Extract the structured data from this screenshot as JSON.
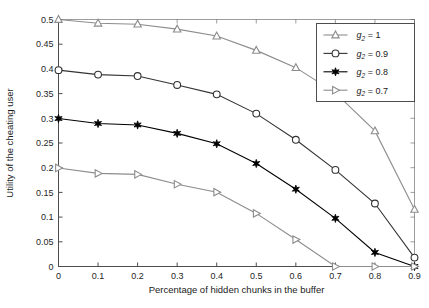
{
  "chart_data": {
    "type": "line",
    "title": "",
    "xlabel": "Percentage of hidden chunks in the buffer",
    "ylabel": "Utility of the cheating user",
    "x": [
      0,
      0.1,
      0.2,
      0.3,
      0.4,
      0.5,
      0.6,
      0.7,
      0.8,
      0.9
    ],
    "xlim": [
      0,
      0.9
    ],
    "ylim": [
      0,
      0.5
    ],
    "xticks": [
      "0",
      "0.1",
      "0.2",
      "0.3",
      "0.4",
      "0.5",
      "0.6",
      "0.7",
      "0.8",
      "0.9"
    ],
    "yticks": [
      "0",
      "0.05",
      "0.1",
      "0.15",
      "0.2",
      "0.25",
      "0.3",
      "0.35",
      "0.4",
      "0.45",
      "0.5"
    ],
    "grid": false,
    "legend_position": "upper-right",
    "series": [
      {
        "name": "g2 = 1",
        "label_var": "g",
        "label_sub": "2",
        "label_value": "= 1",
        "marker": "triangle-up",
        "marker_filled": false,
        "color": "#8c8c8c",
        "values": [
          0.5,
          0.4925,
          0.4905,
          0.4805,
          0.4665,
          0.4375,
          0.4025,
          0.3515,
          0.2745,
          0.1155
        ]
      },
      {
        "name": "g2 = 0.9",
        "label_var": "g",
        "label_sub": "2",
        "label_value": "= 0.9",
        "marker": "circle",
        "marker_filled": false,
        "color": "#333333",
        "values": [
          0.3975,
          0.3885,
          0.3855,
          0.3675,
          0.3485,
          0.3095,
          0.2565,
          0.1955,
          0.1275,
          0.018
        ]
      },
      {
        "name": "g2 = 0.8",
        "label_var": "g",
        "label_sub": "2",
        "label_value": "= 0.8",
        "marker": "star",
        "marker_filled": true,
        "color": "#000000",
        "values": [
          0.2995,
          0.2895,
          0.2865,
          0.2695,
          0.2485,
          0.2085,
          0.1565,
          0.0975,
          0.0285,
          0.0
        ]
      },
      {
        "name": "g2 = 0.7",
        "label_var": "g",
        "label_sub": "2",
        "label_value": "= 0.7",
        "marker": "triangle-right",
        "marker_filled": false,
        "color": "#8c8c8c",
        "values": [
          0.1995,
          0.1885,
          0.1865,
          0.1665,
          0.1505,
          0.1075,
          0.0545,
          0.0,
          0.0,
          0.0
        ]
      }
    ]
  }
}
